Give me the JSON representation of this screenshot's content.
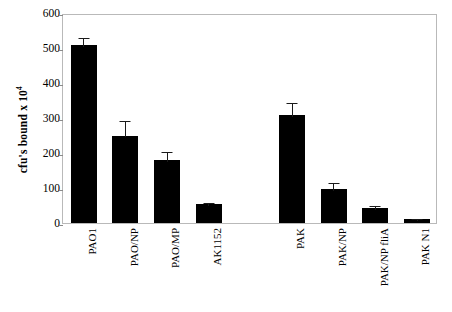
{
  "chart_data": {
    "type": "bar",
    "title": "",
    "subtitle": "",
    "xlabel": "",
    "ylabel": "cfu's bound  x 10",
    "ylabel_exponent": "4",
    "ylim": [
      0,
      600
    ],
    "yticks": [
      0,
      100,
      200,
      300,
      400,
      500,
      600
    ],
    "ytick_labels": [
      "0",
      "100",
      "200",
      "300",
      "400",
      "500",
      "600"
    ],
    "grid": false,
    "legend": "none",
    "bar_color": "#000000",
    "error_bar_color": "#1a1a1a",
    "axis_color": "#b9b9b9",
    "background_color": "#ffffff",
    "categories": [
      "PAO1",
      "PAO/NP",
      "PAO/MP",
      "AK1152",
      "",
      "PAK",
      "PAK/NP",
      "PAK/NP fliA",
      "PAK N1"
    ],
    "values": [
      510,
      250,
      180,
      55,
      null,
      308,
      98,
      43,
      12
    ],
    "errors": [
      25,
      48,
      30,
      8,
      null,
      40,
      22,
      12,
      4
    ],
    "bars": [
      {
        "label": "PAO1",
        "value": 510,
        "error": 25
      },
      {
        "label": "PAO/NP",
        "value": 250,
        "error": 48
      },
      {
        "label": "PAO/MP",
        "value": 180,
        "error": 30
      },
      {
        "label": "AK1152",
        "value": 55,
        "error": 8
      },
      {
        "label": "",
        "value": null,
        "error": null
      },
      {
        "label": "PAK",
        "value": 308,
        "error": 40
      },
      {
        "label": "PAK/NP",
        "value": 98,
        "error": 22
      },
      {
        "label": "PAK/NP fliA",
        "value": 43,
        "error": 12
      },
      {
        "label": "PAK N1",
        "value": 12,
        "error": 4
      }
    ]
  }
}
